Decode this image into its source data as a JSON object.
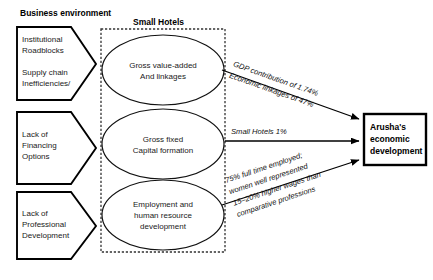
{
  "headers": {
    "left": "Business environment",
    "center": "Small Hotels"
  },
  "drivers": [
    {
      "lines": [
        "Institutional",
        "Roadblocks",
        "",
        "Supply chain",
        "Inefficiencies/"
      ]
    },
    {
      "lines": [
        "Lack of",
        "Financing",
        "Options"
      ]
    },
    {
      "lines": [
        "Lack of",
        "Professional",
        "Development"
      ]
    }
  ],
  "hotel_factors": [
    {
      "lines": [
        "Gross value-added",
        "And linkages"
      ]
    },
    {
      "lines": [
        "Gross fixed",
        "Capital formation"
      ]
    },
    {
      "lines": [
        "Employment and",
        "human resource",
        "development"
      ]
    }
  ],
  "outcome": {
    "lines": [
      "Arusha's",
      "economic",
      "development"
    ]
  },
  "connector_labels": [
    {
      "lines": [
        "GDP contribution of 1.74%",
        "Economic linkages of 47%"
      ]
    },
    {
      "lines": [
        "Small Hotels 1%"
      ]
    },
    {
      "lines": [
        "75% full time employed;",
        "women well represented",
        "15–20% higher wages than",
        "comparative professions"
      ]
    }
  ],
  "colors": {
    "background": "#ffffff",
    "stroke": "#000000",
    "text": "#1a1a1a",
    "dashed": "#333333"
  }
}
